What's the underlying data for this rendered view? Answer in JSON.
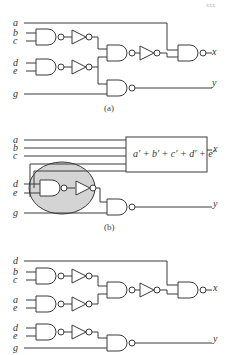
{
  "page_number": "xxx",
  "colors": {
    "line": "#3a3a3a",
    "highlight": "#d4d4d4",
    "text": "#333333"
  },
  "panel_a": {
    "caption": "(a)",
    "inputs": {
      "a": "a",
      "b": "b",
      "c": "c",
      "d": "d",
      "e": "e",
      "g": "g"
    },
    "outputs": {
      "x": "x",
      "y": "y"
    }
  },
  "panel_b": {
    "caption": "(b)",
    "inputs": {
      "a": "a",
      "b": "b",
      "c": "c",
      "d": "d",
      "e": "e",
      "g": "g"
    },
    "outputs": {
      "x": "x",
      "y": "y"
    },
    "box_expression": "a′ + b′ + c′ + d′ + e′"
  },
  "panel_c": {
    "inputs": {
      "d1": "d",
      "b": "b",
      "c": "c",
      "a": "a",
      "e1": "e",
      "d2": "d",
      "e2": "e",
      "g": "g"
    },
    "outputs": {
      "x": "x",
      "y": "y"
    }
  }
}
